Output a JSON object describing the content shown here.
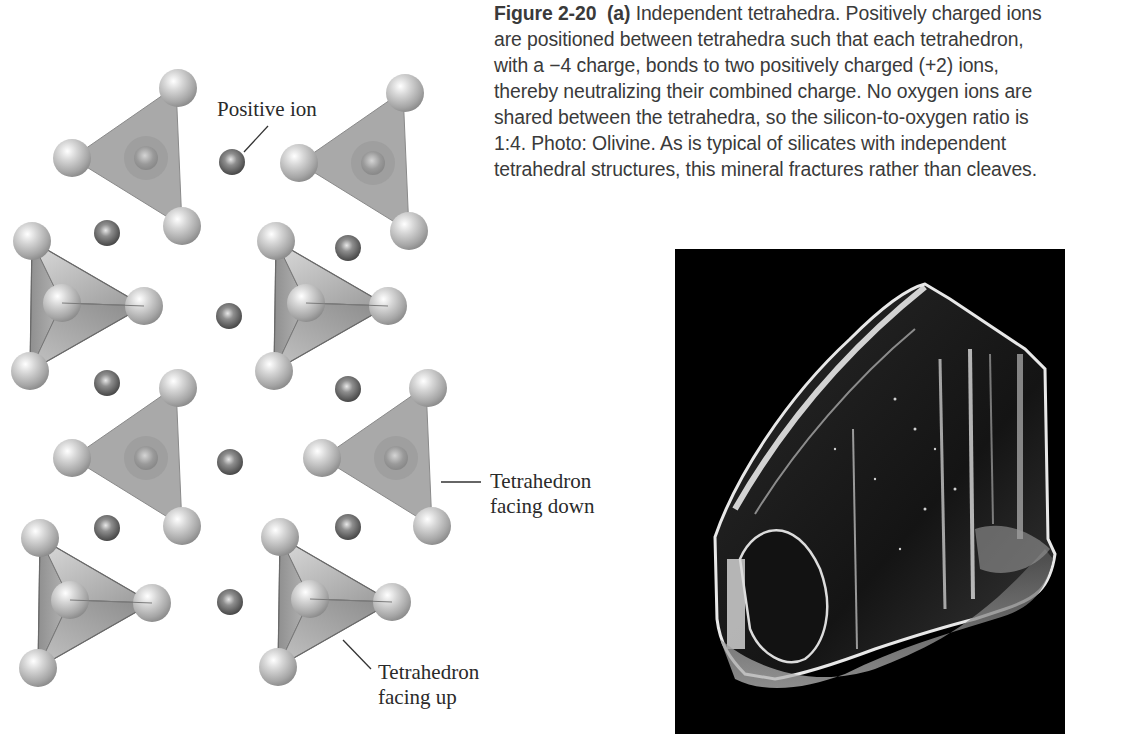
{
  "caption": {
    "figure_number": "Figure 2-20",
    "part": "(a)",
    "lines": [
      " Independent tetrahedra. Positively charged ions",
      "are positioned between tetrahedra such that each tetrahedron,",
      "with a −4 charge, bonds to two positively charged (+2) ions,",
      "thereby neutralizing their combined charge. No oxygen ions are",
      "shared between the tetrahedra, so the silicon-to-oxygen ratio is",
      "1:4. Photo: Olivine. As is typical of silicates with independent",
      "tetrahedral structures, this mineral fractures rather than cleaves."
    ]
  },
  "diagram": {
    "labels": {
      "positive_ion": "Positive ion",
      "facing_down_line1": "Tetrahedron",
      "facing_down_line2": "facing down",
      "facing_up_line1": "Tetrahedron",
      "facing_up_line2": "facing up"
    },
    "colors": {
      "tetra_face": "#a9a9a9",
      "oxygen_sphere": "#c8c8c8",
      "positive_ion": "#6e6e6e"
    }
  },
  "photo": {
    "subject": "Olivine",
    "background": "#000000"
  }
}
